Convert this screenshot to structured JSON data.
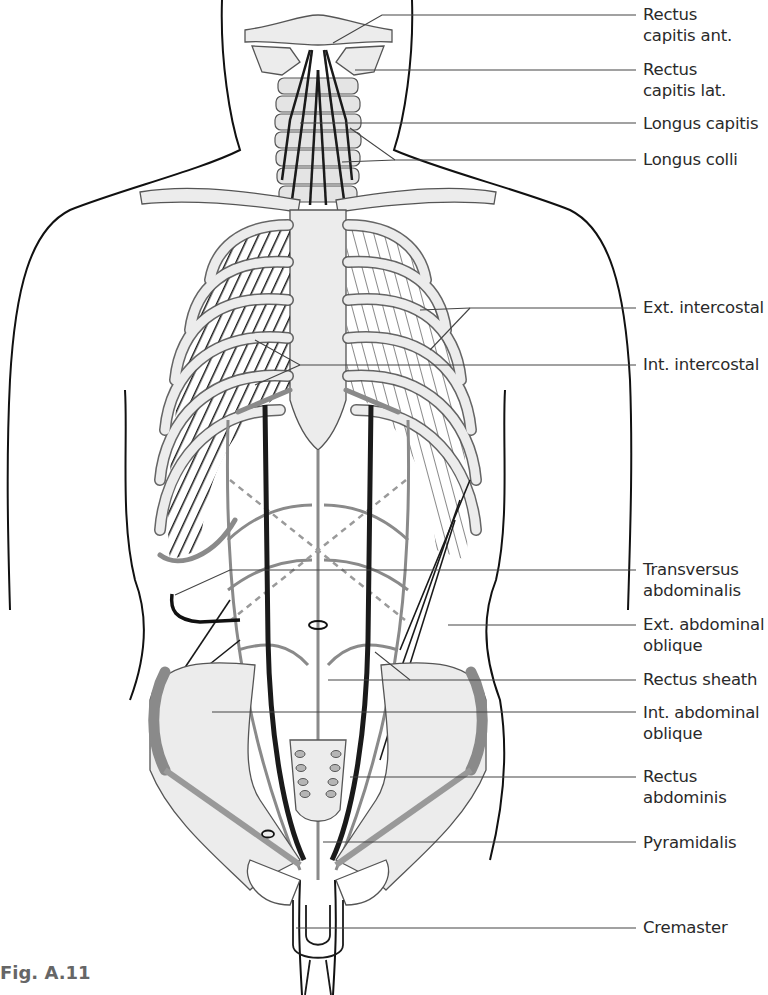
{
  "figure": {
    "caption": "Fig. A.11",
    "colors": {
      "bone_fill": "#ececec",
      "outline": "#555555",
      "muscle_dark": "#1a1a1a",
      "muscle_gray": "#8a8a8a",
      "leader_line": "#444444",
      "background": "#ffffff"
    }
  },
  "labels": [
    {
      "id": "rectus-capitis-ant",
      "text": "Rectus\ncapitis ant.",
      "y": 6
    },
    {
      "id": "rectus-capitis-lat",
      "text": "Rectus\ncapitis lat.",
      "y": 61
    },
    {
      "id": "longus-capitis",
      "text": "Longus capitis",
      "y": 116
    },
    {
      "id": "longus-colli",
      "text": "Longus colli",
      "y": 150
    },
    {
      "id": "ext-intercostal",
      "text": "Ext. intercostal",
      "y": 298
    },
    {
      "id": "int-intercostal",
      "text": "Int. intercostal",
      "y": 354
    },
    {
      "id": "transversus-abdominalis",
      "text": "Transversus\nabdominalis",
      "y": 560
    },
    {
      "id": "ext-abdominal-oblique",
      "text": "Ext. abdominal\noblique",
      "y": 614
    },
    {
      "id": "rectus-sheath",
      "text": "Rectus sheath",
      "y": 670
    },
    {
      "id": "int-abdominal-oblique",
      "text": "Int. abdominal\noblique",
      "y": 704
    },
    {
      "id": "rectus-abdominis",
      "text": "Rectus\nabdominis",
      "y": 767
    },
    {
      "id": "pyramidalis",
      "text": "Pyramidalis",
      "y": 833
    },
    {
      "id": "cremaster",
      "text": "Cremaster",
      "y": 918
    }
  ]
}
